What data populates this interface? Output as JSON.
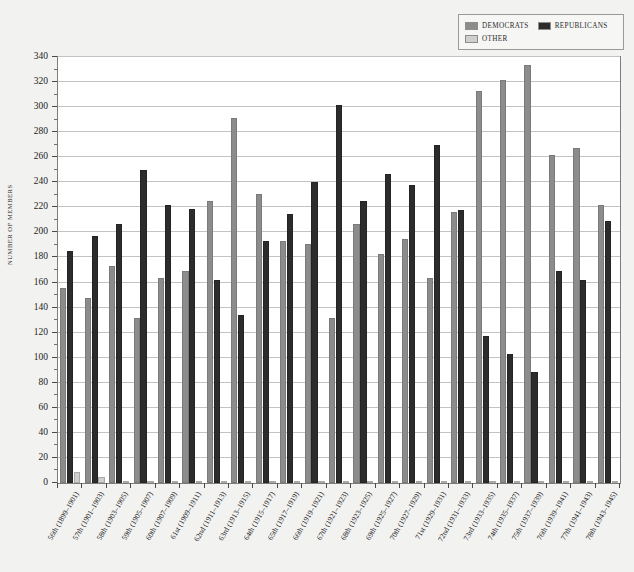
{
  "chart_data": {
    "type": "bar",
    "title": "",
    "subtitle": "",
    "xlabel": "",
    "ylabel": "NUMBER OF MEMBERS",
    "ylim": [
      0,
      340
    ],
    "ytick_step": 20,
    "yminor_step": 10,
    "grid": true,
    "legend_position": "top-right",
    "yticks": [
      0,
      20,
      40,
      60,
      80,
      100,
      120,
      140,
      160,
      180,
      200,
      220,
      240,
      260,
      280,
      300,
      320,
      340
    ],
    "categories": [
      "56th (1899–1901)",
      "57th (1901–1903)",
      "58th (1903–1905)",
      "59th (1905–1907)",
      "60th (1907–1909)",
      "61st (1909–1911)",
      "62nd (1911–1913)",
      "63rd (1913–1915)",
      "64th (1915–1917)",
      "65th (1917–1919)",
      "66th (1919–1921)",
      "67th (1921–1923)",
      "68th (1923–1925)",
      "69th (1925–1927)",
      "70th (1927–1929)",
      "71st (1929–1931)",
      "72nd (1931–1933)",
      "73rd (1933–1935)",
      "74th (1935–1937)",
      "75th (1937–1939)",
      "76th (1939–1941)",
      "77th (1941–1943)",
      "78th (1943–1945)"
    ],
    "series": [
      {
        "name": "DEMOCRATS",
        "color": "#8c8c8c",
        "values": [
          156,
          148,
          173,
          132,
          164,
          169,
          225,
          291,
          231,
          193,
          191,
          132,
          207,
          183,
          195,
          164,
          216,
          313,
          322,
          334,
          262,
          267,
          222
        ]
      },
      {
        "name": "REPUBLICANS",
        "color": "#2c2c2c",
        "values": [
          185,
          197,
          207,
          250,
          222,
          219,
          162,
          134,
          193,
          215,
          240,
          302,
          225,
          247,
          238,
          270,
          218,
          117,
          103,
          89,
          169,
          162,
          209
        ]
      },
      {
        "name": "OTHER",
        "color": "#cfcfcf",
        "values": [
          9,
          5,
          0,
          0,
          0,
          0,
          0,
          0,
          0,
          0,
          0,
          0,
          0,
          0,
          0,
          0,
          0,
          0,
          0,
          0,
          0,
          0,
          0
        ]
      }
    ]
  },
  "legend": {
    "entries": [
      {
        "label": "DEMOCRATS",
        "color": "#8c8c8c"
      },
      {
        "label": "REPUBLICANS",
        "color": "#2c2c2c"
      },
      {
        "label": "OTHER",
        "color": "#cfcfcf"
      }
    ]
  },
  "axis": {
    "y_title": "NUMBER OF MEMBERS"
  },
  "colors": {
    "democrats": "#8c8c8c",
    "republicans": "#2c2c2c",
    "other": "#cfcfcf",
    "plot_background": "#ffffff",
    "page_background": "#f2f2f1",
    "gridline": "#c3c3c3",
    "frame": "#7d7d7d"
  }
}
